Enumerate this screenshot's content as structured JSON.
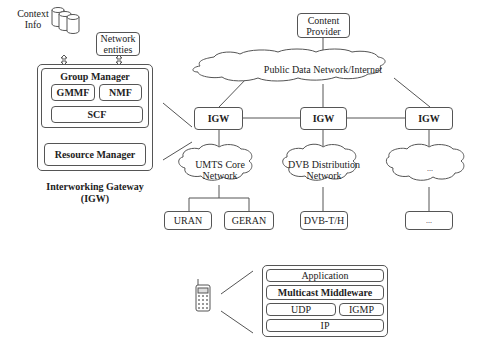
{
  "top_left": {
    "context_info": "Context\nInfo",
    "network_entities": "Network\nentities"
  },
  "igw_detail": {
    "group_manager": "Group Manager",
    "gmmf": "GMMF",
    "nmf": "NMF",
    "scf": "SCF",
    "resource_manager": "Resource Manager",
    "caption_line1": "Interworking Gateway",
    "caption_line2": "(IGW)"
  },
  "network": {
    "content_provider_line1": "Content",
    "content_provider_line2": "Provider",
    "internet": "Public Data Network/Internet",
    "igw_labels": [
      "IGW",
      "IGW",
      "IGW"
    ],
    "clouds": [
      {
        "line1": "UMTS Core",
        "line2": "Network"
      },
      {
        "line1": "DVB Distribution",
        "line2": "Network"
      },
      {
        "line1": "...",
        "line2": ""
      }
    ],
    "access": [
      "URAN",
      "GERAN",
      "DVB-T/H",
      "..."
    ]
  },
  "stack": {
    "application": "Application",
    "middleware": "Multicast Middleware",
    "udp": "UDP",
    "igmp": "IGMP",
    "ip": "IP"
  },
  "colors": {
    "stroke": "#555555",
    "text": "#222222",
    "background": "#ffffff"
  }
}
